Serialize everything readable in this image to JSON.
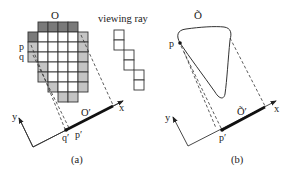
{
  "figure": {
    "panel_a": {
      "caption": "(a)",
      "object_label": "O",
      "projection_label": "O′",
      "point_p": "p",
      "point_q": "q",
      "point_p_proj": "p′",
      "point_q_proj": "q′",
      "axis_x": "x",
      "axis_y": "y",
      "viewing_ray_label": "viewing ray",
      "colors": {
        "dark_cell": "#7a7a7a",
        "light_cell": "#c4c4c4",
        "empty_cell": "#ffffff",
        "line": "#333333"
      }
    },
    "panel_b": {
      "caption": "(b)",
      "object_label": "Õ",
      "projection_label": "Õ′",
      "point_p": "p",
      "point_p_proj": "p′",
      "axis_x": "x",
      "axis_y": "y"
    }
  }
}
